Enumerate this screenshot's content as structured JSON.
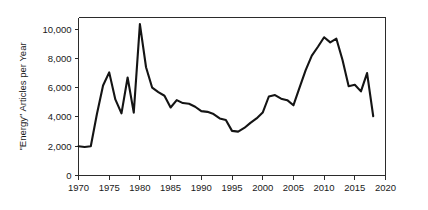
{
  "chart_data": {
    "type": "line",
    "title": "",
    "xlabel": "",
    "ylabel": "\"Energy\" Articles per Year",
    "xlim": [
      1970,
      2020
    ],
    "ylim": [
      0,
      10800
    ],
    "grid": false,
    "legend": null,
    "xticks": [
      1970,
      1975,
      1980,
      1985,
      1990,
      1995,
      2000,
      2005,
      2010,
      2015,
      2020
    ],
    "xtick_labels": [
      "1970",
      "1975",
      "1980",
      "1985",
      "1990",
      "1995",
      "2000",
      "2005",
      "2010",
      "2015",
      "2020"
    ],
    "yticks": [
      0,
      2000,
      4000,
      6000,
      8000,
      10000
    ],
    "ytick_labels": [
      "0",
      "2,000",
      "4,000",
      "6,000",
      "8,000",
      "10,000"
    ],
    "series": [
      {
        "name": "\"Energy\" Articles per Year",
        "color": "#141414",
        "x": [
          1970,
          1971,
          1972,
          1973,
          1974,
          1975,
          1976,
          1977,
          1978,
          1979,
          1980,
          1981,
          1982,
          1983,
          1984,
          1985,
          1986,
          1987,
          1988,
          1989,
          1990,
          1991,
          1992,
          1993,
          1994,
          1995,
          1996,
          1997,
          1998,
          1999,
          2000,
          2001,
          2002,
          2003,
          2004,
          2005,
          2006,
          2007,
          2008,
          2009,
          2010,
          2011,
          2012,
          2013,
          2014,
          2015,
          2016,
          2017,
          2018
        ],
        "values": [
          2000,
          1950,
          2000,
          4200,
          6150,
          7050,
          5200,
          4250,
          6700,
          4300,
          10350,
          7400,
          6000,
          5700,
          5450,
          4650,
          5150,
          4950,
          4900,
          4700,
          4400,
          4350,
          4200,
          3900,
          3800,
          3050,
          3000,
          3250,
          3600,
          3900,
          4300,
          5400,
          5500,
          5250,
          5150,
          4800,
          6000,
          7200,
          8200,
          8800,
          9450,
          9100,
          9350,
          7900,
          6100,
          6200,
          5750,
          7000,
          4050
        ]
      }
    ]
  }
}
